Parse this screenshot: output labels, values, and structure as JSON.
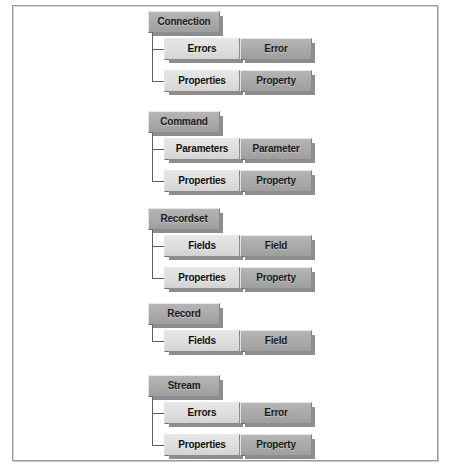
{
  "diagram": {
    "type": "tree-diagram",
    "colors": {
      "parent_box": "#a9a9a9",
      "collection_box": "#dedede",
      "object_box": "#a9a9a9",
      "connector": "#5e5e5e",
      "frame": "#9a9a9a",
      "shadow": "#8d8d8d",
      "background": "#ffffff"
    },
    "groups": [
      {
        "id": "connection",
        "parent": {
          "label": "Connection"
        },
        "children": [
          {
            "collection": "Errors",
            "object": "Error"
          },
          {
            "collection": "Properties",
            "object": "Property"
          }
        ]
      },
      {
        "id": "command",
        "parent": {
          "label": "Command"
        },
        "children": [
          {
            "collection": "Parameters",
            "object": "Parameter"
          },
          {
            "collection": "Properties",
            "object": "Property"
          }
        ]
      },
      {
        "id": "recordset",
        "parent": {
          "label": "Recordset"
        },
        "children": [
          {
            "collection": "Fields",
            "object": "Field"
          },
          {
            "collection": "Properties",
            "object": "Property"
          }
        ]
      },
      {
        "id": "record",
        "parent": {
          "label": "Record"
        },
        "children": [
          {
            "collection": "Fields",
            "object": "Field"
          }
        ]
      },
      {
        "id": "stream",
        "parent": {
          "label": "Stream"
        },
        "children": [
          {
            "collection": "Errors",
            "object": "Error"
          },
          {
            "collection": "Properties",
            "object": "Property"
          }
        ]
      }
    ]
  }
}
